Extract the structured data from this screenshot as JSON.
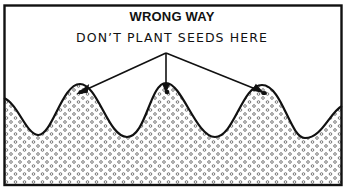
{
  "diagram": {
    "title": "WRONG WAY",
    "caption": "DON’T PLANT SEEDS HERE",
    "elements": {
      "frame": "rectangular border",
      "soil": "stippled soil with wavy ridged surface (furrows)",
      "ridge_crests": 3,
      "arrows": 3,
      "arrow_targets": [
        "left ridge crest",
        "middle ridge crest",
        "right ridge crest"
      ],
      "seed_marks": "small dark seeds at top of each ridge"
    },
    "colors": {
      "line": "#111111",
      "background": "#ffffff",
      "stipple": "#777777"
    }
  }
}
